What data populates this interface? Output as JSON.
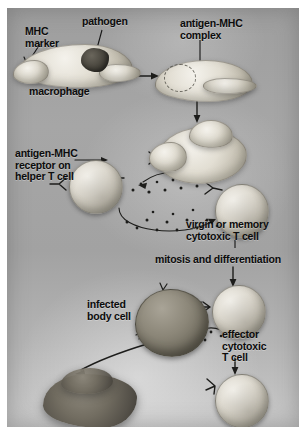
{
  "figure": {
    "domain": "diagram",
    "panel_background_color": "#a8a8a8",
    "label_color": "#0c0c0c"
  },
  "labels": {
    "mhc_marker": "MHC\nmarker",
    "pathogen": "pathogen",
    "antigen_mhc_complex": "antigen-MHC\ncomplex",
    "macrophage": "macrophage",
    "antigen_mhc_receptor": "antigen-MHC\nreceptor on\nhelper T cell",
    "virgin_or_memory": "virgin or memory\ncytotoxic T cell",
    "mitosis": "mitosis and differentiation",
    "infected_body_cell": "infected\nbody cell",
    "effector_cytotoxic": "effector\ncytotoxic\nT cell"
  },
  "cells": [
    {
      "name": "macrophage-engulfing",
      "stage": 1,
      "type": "amoeboid-phagocyte"
    },
    {
      "name": "macrophage-presenting",
      "stage": 2,
      "type": "amoeboid-phagocyte"
    },
    {
      "name": "antigen-presenting-cell",
      "stage": 3,
      "type": "amoeboid-phagocyte"
    },
    {
      "name": "helper-t-cell",
      "stage": 3,
      "type": "lymphocyte"
    },
    {
      "name": "virgin-memory-cytotoxic-t-cell",
      "stage": 4,
      "type": "lymphocyte"
    },
    {
      "name": "infected-body-cell",
      "stage": 5,
      "type": "infected-cell"
    },
    {
      "name": "effector-cytotoxic-t-cell-attacking",
      "stage": 5,
      "type": "lymphocyte"
    },
    {
      "name": "effector-cytotoxic-t-cell",
      "stage": 6,
      "type": "lymphocyte"
    },
    {
      "name": "destroyed-cell",
      "stage": 6,
      "type": "lysed-debris"
    }
  ],
  "arrows": [
    {
      "name": "arrow-macrophage-to-presenting",
      "direction": "right"
    },
    {
      "name": "arrow-presenting-to-tcells",
      "direction": "down"
    },
    {
      "name": "arrow-cytokine-helper-to-cytotoxic",
      "direction": "curved-right"
    },
    {
      "name": "arrow-cytokine-loop",
      "direction": "curved-left"
    },
    {
      "name": "arrow-mitosis",
      "direction": "down"
    },
    {
      "name": "arrow-effector-down",
      "direction": "down"
    },
    {
      "name": "arrow-lysis",
      "direction": "curved-down-left"
    }
  ]
}
